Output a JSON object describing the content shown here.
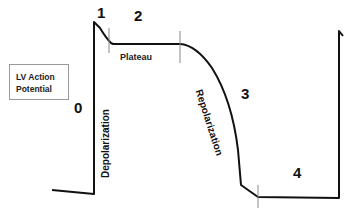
{
  "diagram": {
    "title_box": {
      "line1": "LV Action",
      "line2": "Potential"
    },
    "phases": [
      {
        "id": "0",
        "label": "0"
      },
      {
        "id": "1",
        "label": "1"
      },
      {
        "id": "2",
        "label": "2"
      },
      {
        "id": "3",
        "label": "3"
      },
      {
        "id": "4",
        "label": "4"
      }
    ],
    "annotations": {
      "plateau": "Plateau",
      "depolarization": "Depolarization",
      "repolarization": "Repolarization"
    },
    "colors": {
      "line": "#111111",
      "tick": "#888888",
      "box_border": "#9a9a9a"
    }
  }
}
